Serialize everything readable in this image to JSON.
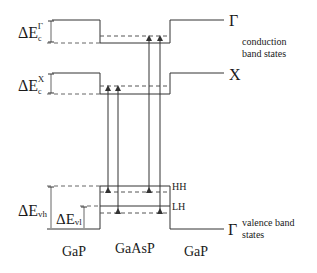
{
  "diagram": {
    "labels": {
      "delta_ec_gamma": {
        "base": "ΔE",
        "sub": "c",
        "sup": "Γ"
      },
      "delta_ec_x": {
        "base": "ΔE",
        "sub": "c",
        "sup": "X"
      },
      "delta_evh": {
        "base": "ΔE",
        "sub": "vh"
      },
      "delta_evl": {
        "base": "ΔE",
        "sub": "vl"
      },
      "gamma_cb": "Γ",
      "x_cb": "X",
      "gamma_vb": "Γ",
      "hh": "HH",
      "lh": "LH",
      "conduction_line1": "conduction",
      "conduction_line2": "band states",
      "valence_line1": "valence band",
      "valence_line2": "states"
    },
    "materials": [
      "GaP",
      "GaAsP",
      "GaP"
    ],
    "colors": {
      "line": "#333333",
      "dash": "#555555",
      "text": "#1a1a1a"
    }
  }
}
